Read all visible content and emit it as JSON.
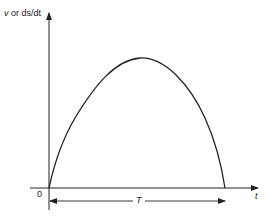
{
  "diagram": {
    "type": "velocity-time curve",
    "y_axis_label": {
      "var1": "v",
      "or": "or",
      "var2": "ds/dt"
    },
    "x_axis_label": "t",
    "origin_label": "0",
    "duration_label": "T",
    "curve": {
      "shape": "asymmetric arch",
      "start": [
        0,
        0
      ],
      "peak_fraction_of_T": 0.53,
      "end": [
        "T",
        0
      ]
    },
    "colors": {
      "stroke": "#222222",
      "background": "#ffffff"
    }
  }
}
